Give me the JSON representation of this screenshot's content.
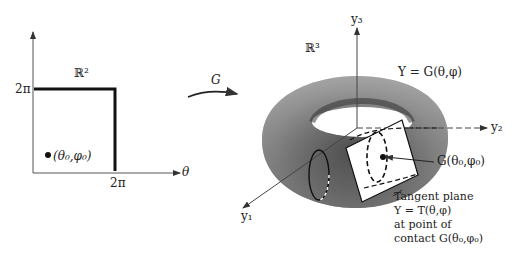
{
  "left_plot": {
    "space_label": "ℝ²",
    "y_tick": "2π",
    "x_tick": "2π",
    "x_axis_label": "θ",
    "point_label": "(θ₀,φ₀)"
  },
  "mapping": {
    "label": "G"
  },
  "right_plot": {
    "space_label": "ℝ³",
    "axis_y1": "y₁",
    "axis_y2": "y₂",
    "axis_y3": "y₃",
    "surface_label": "Y = G(θ,φ)",
    "contact_point_label": "G(θ₀,φ₀)",
    "tangent_caption": {
      "line1": "Tangent plane",
      "line2": "Y = T(θ,φ)",
      "line3": "at point of",
      "line4": "contact G(θ₀,φ₀)"
    }
  }
}
